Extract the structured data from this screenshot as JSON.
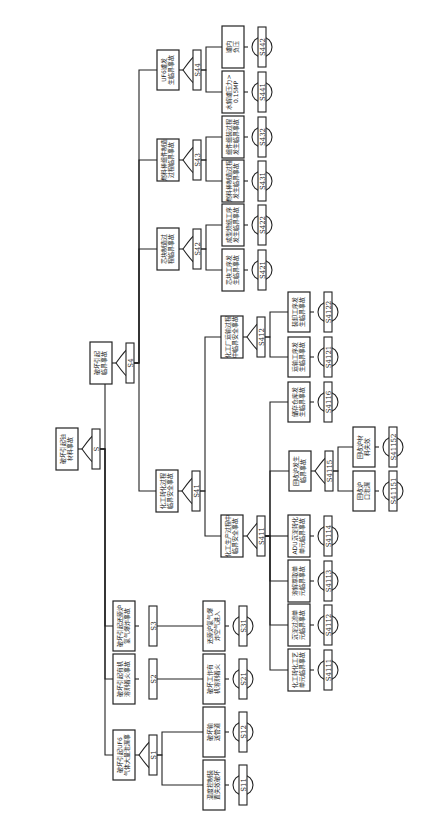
{
  "diagram": {
    "type": "fault-tree",
    "orientation": "rotated-90-ccw",
    "top_event": {
      "id": "S",
      "label": "破坏引起铀材料事故"
    },
    "nodes": [
      {
        "id": "S1",
        "label": "破坏引起UF6气体大量泄漏事故",
        "gate": "OR",
        "children": [
          "S11",
          "S12"
        ]
      },
      {
        "id": "S11",
        "label": "温度控制装置失效破坏",
        "type": "basic"
      },
      {
        "id": "S12",
        "label": "破坏输送管道",
        "type": "basic"
      },
      {
        "id": "S2",
        "label": "破坏引起有机溶剂着火事故",
        "gate": "direct",
        "children": [
          "S21"
        ]
      },
      {
        "id": "S21",
        "label": "破坏工作有机溶剂着火",
        "type": "basic"
      },
      {
        "id": "S3",
        "label": "破坏引起还原炉氢气爆炸事故",
        "gate": "direct",
        "children": [
          "S31"
        ]
      },
      {
        "id": "S31",
        "label": "还原炉氢气爆炸空气进入",
        "type": "basic"
      },
      {
        "id": "S4",
        "label": "破坏引起临界事故",
        "gate": "OR",
        "children": [
          "S41",
          "S42",
          "S43",
          "S44"
        ]
      },
      {
        "id": "S41",
        "label": "化工转化过程临界安全事故",
        "gate": "OR",
        "children": [
          "S411",
          "S412"
        ]
      },
      {
        "id": "S411",
        "label": "化工生产过程中临界安全事故",
        "gate": "OR",
        "children": [
          "S4111",
          "S4112",
          "S4113",
          "S4114",
          "S4115",
          "S4116"
        ]
      },
      {
        "id": "S4111",
        "label": "化工转化工艺单元临界事故",
        "type": "basic"
      },
      {
        "id": "S4112",
        "label": "沉淀过滤单元临界事故",
        "type": "basic"
      },
      {
        "id": "S4113",
        "label": "溶解萃取单元临界事故",
        "type": "basic"
      },
      {
        "id": "S4114",
        "label": "ADU沉淀转化单元临界事故",
        "type": "basic"
      },
      {
        "id": "S4115",
        "label": "回收炉发生临界事故",
        "gate": "OR",
        "children": [
          "S41151",
          "S41152"
        ]
      },
      {
        "id": "S41151",
        "label": "回收炉口泄漏",
        "type": "basic"
      },
      {
        "id": "S41152",
        "label": "回收炉材料失效",
        "type": "basic"
      },
      {
        "id": "S4116",
        "label": "储存仓库发生临界事故",
        "type": "basic"
      },
      {
        "id": "S412",
        "label": "化工厂运输过程中临界安全事故",
        "gate": "OR",
        "children": [
          "S4121",
          "S4122"
        ]
      },
      {
        "id": "S4121",
        "label": "运输工序发生临界事故",
        "type": "basic"
      },
      {
        "id": "S4122",
        "label": "装卸工序发生临界事故",
        "type": "basic"
      },
      {
        "id": "S42",
        "label": "芯块制造过程临界事故",
        "gate": "OR",
        "children": [
          "S421",
          "S422"
        ]
      },
      {
        "id": "S421",
        "label": "芯块工序发生临界事故",
        "type": "basic"
      },
      {
        "id": "S422",
        "label": "成型烧结工序发生临界事故",
        "type": "basic"
      },
      {
        "id": "S43",
        "label": "燃料棒组件制造过程临界事故",
        "gate": "OR",
        "children": [
          "S431",
          "S432"
        ]
      },
      {
        "id": "S431",
        "label": "燃料棒制造过程发生临界事故",
        "type": "basic"
      },
      {
        "id": "S432",
        "label": "组件组装过程发生临界事故",
        "type": "basic"
      },
      {
        "id": "S44",
        "label": "UF6罐发生临界事故",
        "gate": "OR",
        "children": [
          "S441",
          "S442"
        ]
      },
      {
        "id": "S441",
        "label": "水解罐压力>0.15MP",
        "type": "basic"
      },
      {
        "id": "S442",
        "label": "罐内负压",
        "type": "basic"
      }
    ]
  },
  "layout": {
    "boxes": [
      {
        "id": "S",
        "x": 56,
        "y": 428,
        "w": 22,
        "h": 42
      },
      {
        "id": "S4",
        "x": 90,
        "y": 342,
        "w": 22,
        "h": 42
      },
      {
        "id": "S44",
        "x": 157,
        "y": 50,
        "w": 22,
        "h": 40
      },
      {
        "id": "S43",
        "x": 157,
        "y": 139,
        "w": 22,
        "h": 42
      },
      {
        "id": "S42",
        "x": 157,
        "y": 228,
        "w": 22,
        "h": 42
      },
      {
        "id": "S41",
        "x": 156,
        "y": 470,
        "w": 22,
        "h": 42
      },
      {
        "id": "S411",
        "x": 221,
        "y": 515,
        "w": 22,
        "h": 42
      },
      {
        "id": "S412",
        "x": 221,
        "y": 316,
        "w": 22,
        "h": 42
      },
      {
        "id": "S442",
        "x": 222,
        "y": 26,
        "w": 22,
        "h": 42
      },
      {
        "id": "S441",
        "x": 222,
        "y": 71,
        "w": 22,
        "h": 42
      },
      {
        "id": "S432",
        "x": 222,
        "y": 116,
        "w": 22,
        "h": 42
      },
      {
        "id": "S431",
        "x": 222,
        "y": 160,
        "w": 22,
        "h": 42
      },
      {
        "id": "S422",
        "x": 222,
        "y": 204,
        "w": 22,
        "h": 42
      },
      {
        "id": "S421",
        "x": 222,
        "y": 249,
        "w": 22,
        "h": 42
      },
      {
        "id": "S4122",
        "x": 288,
        "y": 292,
        "w": 22,
        "h": 40
      },
      {
        "id": "S4121",
        "x": 288,
        "y": 337,
        "w": 22,
        "h": 40
      },
      {
        "id": "S4116",
        "x": 288,
        "y": 382,
        "w": 22,
        "h": 40
      },
      {
        "id": "S4115",
        "x": 289,
        "y": 451,
        "w": 22,
        "h": 40
      },
      {
        "id": "S41152",
        "x": 353,
        "y": 427,
        "w": 22,
        "h": 40
      },
      {
        "id": "S41151",
        "x": 353,
        "y": 471,
        "w": 22,
        "h": 40
      },
      {
        "id": "S4114",
        "x": 288,
        "y": 515,
        "w": 22,
        "h": 42
      },
      {
        "id": "S4113",
        "x": 288,
        "y": 560,
        "w": 22,
        "h": 42
      },
      {
        "id": "S4112",
        "x": 288,
        "y": 604,
        "w": 22,
        "h": 42
      },
      {
        "id": "S4111",
        "x": 288,
        "y": 649,
        "w": 22,
        "h": 42
      },
      {
        "id": "S3",
        "x": 113,
        "y": 601,
        "w": 22,
        "h": 50
      },
      {
        "id": "S2",
        "x": 113,
        "y": 654,
        "w": 22,
        "h": 50
      },
      {
        "id": "S1",
        "x": 113,
        "y": 730,
        "w": 22,
        "h": 50
      },
      {
        "id": "S31",
        "x": 203,
        "y": 601,
        "w": 22,
        "h": 50
      },
      {
        "id": "S21",
        "x": 203,
        "y": 654,
        "w": 22,
        "h": 50
      },
      {
        "id": "S12",
        "x": 203,
        "y": 707,
        "w": 22,
        "h": 50
      },
      {
        "id": "S11",
        "x": 203,
        "y": 760,
        "w": 22,
        "h": 50
      }
    ]
  }
}
